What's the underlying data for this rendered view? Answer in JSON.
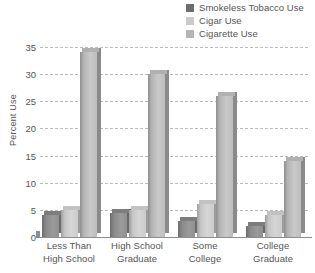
{
  "chart_data": {
    "type": "bar",
    "title": "",
    "xlabel": "",
    "ylabel": "Percent Use",
    "ylim": [
      0,
      35
    ],
    "ytick_step": 5,
    "yticks": [
      0,
      5,
      10,
      15,
      20,
      25,
      30,
      35
    ],
    "grid": true,
    "legend_position": "top-right",
    "style": "3d-grouped-bar",
    "categories": [
      "Less Than\nHigh School",
      "High School\nGraduate",
      "Some\nCollege",
      "College\nGraduate"
    ],
    "series": [
      {
        "name": "Smokeless Tobacco Use",
        "color": "#6d6d6d",
        "values": [
          4,
          4.5,
          3,
          2
        ]
      },
      {
        "name": "Cigar Use",
        "color": "#cbcbcb",
        "values": [
          5,
          5,
          6,
          4
        ]
      },
      {
        "name": "Cigarette Use",
        "color": "#b5b5b5",
        "values": [
          34,
          30,
          26,
          14
        ]
      }
    ]
  },
  "legend": {
    "items": [
      {
        "label": "Smokeless Tobacco Use",
        "color": "#6d6d6d"
      },
      {
        "label": "Cigar Use",
        "color": "#cbcbcb"
      },
      {
        "label": "Cigarette Use",
        "color": "#b5b5b5"
      }
    ]
  },
  "axes": {
    "y_label": "Percent Use",
    "y_ticks": [
      "35",
      "30",
      "25",
      "20",
      "15",
      "10",
      "5",
      "0"
    ],
    "x_categories": [
      {
        "line1": "Less Than",
        "line2": "High School"
      },
      {
        "line1": "High School",
        "line2": "Graduate"
      },
      {
        "line1": "Some",
        "line2": "College"
      },
      {
        "line1": "College",
        "line2": "Graduate"
      }
    ]
  }
}
